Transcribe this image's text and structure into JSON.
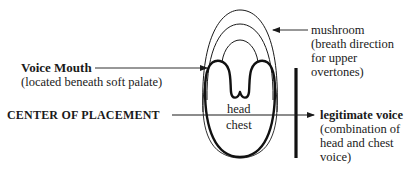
{
  "labels": {
    "voice_mouth": {
      "title": "Voice Mouth",
      "note": "(located beneath soft palate)"
    },
    "center": {
      "title": "CENTER OF PLACEMENT"
    },
    "mushroom": {
      "title": "mushroom",
      "note_lines": [
        "(breath direction",
        "for upper",
        "overtones)"
      ]
    },
    "legitimate": {
      "title": "legitimate voice",
      "note_lines": [
        "(combination of",
        "head and chest",
        "voice)"
      ]
    },
    "inner": {
      "head": "head",
      "chest": "chest"
    }
  },
  "colors": {
    "ink": "#1a1a1a",
    "background": "#ffffff"
  }
}
